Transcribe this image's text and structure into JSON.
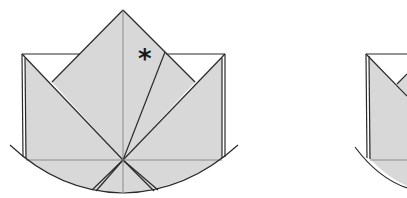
{
  "diagram": {
    "type": "origami-fold-diagram",
    "colors": {
      "paper": "#d8d8d8",
      "line": "#2a2a2a",
      "crease": "#7a7a7a",
      "background": "#ffffff"
    },
    "figures": [
      {
        "id": "step-a",
        "marker": "*",
        "description": "Lotus/waterbomb style fold with raised center point and two side flaps"
      },
      {
        "id": "step-b",
        "marker": "",
        "description": "Next step, partially visible at right edge"
      }
    ]
  }
}
